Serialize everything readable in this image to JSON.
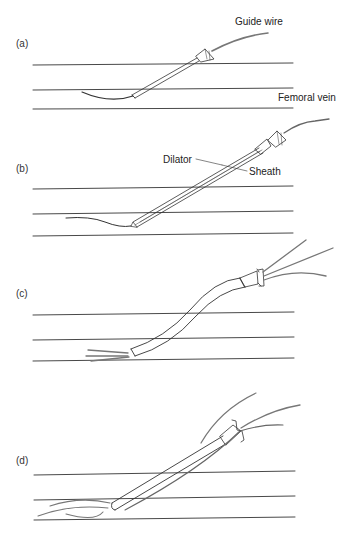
{
  "figure": {
    "panels": [
      {
        "id": "a",
        "label": "(a)"
      },
      {
        "id": "b",
        "label": "(b)"
      },
      {
        "id": "c",
        "label": "(c)"
      },
      {
        "id": "d",
        "label": "(d)"
      }
    ],
    "annotations": {
      "guide_wire": "Guide wire",
      "femoral_vein": "Femoral vein",
      "dilator": "Dilator",
      "sheath": "Sheath"
    },
    "colors": {
      "line": "#333333",
      "wire": "#555555",
      "background": "#ffffff"
    }
  }
}
